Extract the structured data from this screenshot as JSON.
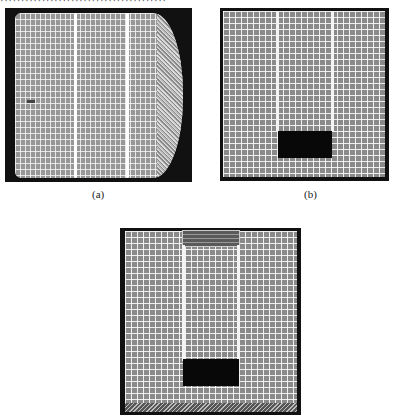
{
  "page": {
    "top_text_cropped": "········································"
  },
  "figures": [
    {
      "id": "a",
      "caption": "(a)",
      "description": "3D cylindrical mesh with two ring bands"
    },
    {
      "id": "b",
      "caption": "(b)",
      "description": "2D cross-section mesh with two vertical lines and black block"
    },
    {
      "id": "c",
      "caption": "",
      "description": "2D cross-section mesh with top layered block, two vertical lines, black block and hatched bottom band"
    }
  ],
  "colors": {
    "mesh_fill": "#8a8a8a",
    "grid_lines": "#ffffff",
    "frame": "#111111",
    "block": "#080808"
  }
}
